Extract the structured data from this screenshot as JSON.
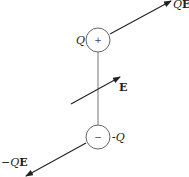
{
  "diagram": {
    "positive_charge": {
      "label": "Q",
      "sign": "+"
    },
    "negative_charge": {
      "label": "-Q",
      "sign": "−"
    },
    "force_on_positive": {
      "label_q": "Q",
      "label_e": "E"
    },
    "force_on_negative": {
      "label_q": "−Q",
      "label_e": "E"
    },
    "field": {
      "label": "E"
    },
    "colors": {
      "stroke": "#222222",
      "rod": "#777777",
      "circle": "#666666"
    }
  }
}
